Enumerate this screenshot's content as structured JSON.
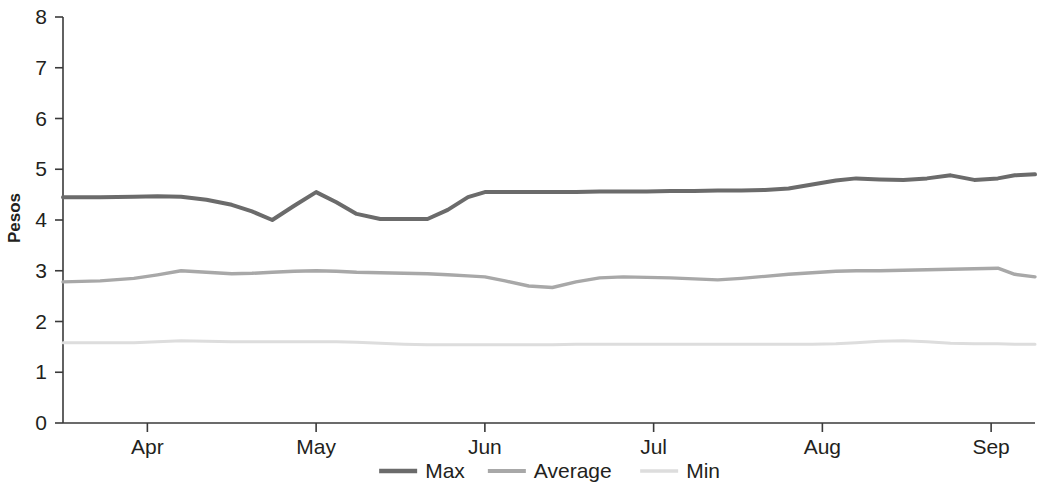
{
  "chart_data": {
    "type": "line",
    "title": "",
    "xlabel": "",
    "ylabel": "Pesos",
    "ylim": [
      0,
      8
    ],
    "ytick_labels": [
      "0",
      "1",
      "2",
      "3",
      "4",
      "5",
      "6",
      "7",
      "8"
    ],
    "ytick_values": [
      0,
      1,
      2,
      3,
      4,
      5,
      6,
      7,
      8
    ],
    "xtick_labels": [
      "Apr",
      "May",
      "Jun",
      "Jul",
      "Aug",
      "Sep"
    ],
    "xtick_positions": [
      1.0,
      2.0,
      3.0,
      4.0,
      5.0,
      6.0
    ],
    "xlim": [
      0.5,
      6.26
    ],
    "grid": false,
    "legend_position": "bottom-center",
    "legend": [
      "Max",
      "Average",
      "Min"
    ],
    "series": [
      {
        "name": "Max",
        "color": "#6b6b6b",
        "width": 4.0,
        "x": [
          0.5,
          0.72,
          0.92,
          1.06,
          1.2,
          1.35,
          1.5,
          1.62,
          1.74,
          1.87,
          2.0,
          2.12,
          2.24,
          2.38,
          2.52,
          2.66,
          2.78,
          2.9,
          3.0,
          3.12,
          3.26,
          3.4,
          3.54,
          3.68,
          3.82,
          3.96,
          4.1,
          4.24,
          4.38,
          4.52,
          4.66,
          4.8,
          4.94,
          5.08,
          5.2,
          5.34,
          5.48,
          5.62,
          5.76,
          5.9,
          6.04,
          6.14,
          6.26
        ],
        "values": [
          4.45,
          4.45,
          4.46,
          4.47,
          4.46,
          4.4,
          4.3,
          4.17,
          4.0,
          4.28,
          4.55,
          4.35,
          4.12,
          4.02,
          4.02,
          4.02,
          4.2,
          4.45,
          4.55,
          4.55,
          4.55,
          4.55,
          4.55,
          4.56,
          4.56,
          4.56,
          4.57,
          4.57,
          4.58,
          4.58,
          4.59,
          4.62,
          4.7,
          4.78,
          4.82,
          4.8,
          4.79,
          4.82,
          4.88,
          4.79,
          4.82,
          4.88,
          4.9
        ]
      },
      {
        "name": "Average",
        "color": "#a8a8a8",
        "width": 3.4,
        "x": [
          0.5,
          0.72,
          0.92,
          1.06,
          1.2,
          1.35,
          1.5,
          1.62,
          1.74,
          1.87,
          2.0,
          2.12,
          2.24,
          2.38,
          2.52,
          2.66,
          2.78,
          2.9,
          3.0,
          3.12,
          3.26,
          3.4,
          3.54,
          3.68,
          3.82,
          3.96,
          4.1,
          4.24,
          4.38,
          4.52,
          4.66,
          4.8,
          4.94,
          5.08,
          5.2,
          5.34,
          5.48,
          5.62,
          5.76,
          5.9,
          6.04,
          6.14,
          6.26
        ],
        "values": [
          2.78,
          2.8,
          2.85,
          2.92,
          3.0,
          2.97,
          2.94,
          2.95,
          2.97,
          2.99,
          3.0,
          2.99,
          2.97,
          2.96,
          2.95,
          2.94,
          2.92,
          2.9,
          2.88,
          2.8,
          2.7,
          2.67,
          2.78,
          2.86,
          2.88,
          2.87,
          2.86,
          2.84,
          2.82,
          2.85,
          2.89,
          2.93,
          2.96,
          2.99,
          3.0,
          3.0,
          3.01,
          3.02,
          3.03,
          3.04,
          3.05,
          2.93,
          2.88
        ]
      },
      {
        "name": "Min",
        "color": "#dddddd",
        "width": 3.0,
        "x": [
          0.5,
          0.72,
          0.92,
          1.06,
          1.2,
          1.35,
          1.5,
          1.62,
          1.74,
          1.87,
          2.0,
          2.12,
          2.24,
          2.38,
          2.52,
          2.66,
          2.78,
          2.9,
          3.0,
          3.12,
          3.26,
          3.4,
          3.54,
          3.68,
          3.82,
          3.96,
          4.1,
          4.24,
          4.38,
          4.52,
          4.66,
          4.8,
          4.94,
          5.08,
          5.2,
          5.34,
          5.48,
          5.62,
          5.76,
          5.9,
          6.04,
          6.14,
          6.26
        ],
        "values": [
          1.58,
          1.58,
          1.58,
          1.6,
          1.62,
          1.61,
          1.6,
          1.6,
          1.6,
          1.6,
          1.6,
          1.6,
          1.59,
          1.57,
          1.55,
          1.54,
          1.54,
          1.54,
          1.54,
          1.54,
          1.54,
          1.54,
          1.55,
          1.55,
          1.55,
          1.55,
          1.55,
          1.55,
          1.55,
          1.55,
          1.55,
          1.55,
          1.55,
          1.56,
          1.58,
          1.61,
          1.62,
          1.6,
          1.57,
          1.56,
          1.56,
          1.55,
          1.55
        ]
      }
    ]
  }
}
